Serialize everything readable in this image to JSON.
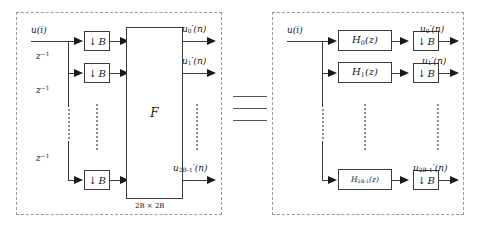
{
  "figure": {
    "relation_symbol": "identical-to",
    "colors": {
      "panel_border": "#9a9a9a",
      "wire": "#3a3a3a",
      "text": "#1a1a1a",
      "dots": "#8d8d8d",
      "background": "#ffffff"
    }
  },
  "left_block": {
    "input_label": "u(i)",
    "delay_labels": [
      "z⁻¹",
      "z⁻¹",
      "z⁻¹"
    ],
    "decimator_symbol": "↓",
    "decimator_factor": "B",
    "decimator_label": "↓ B",
    "transform_label": "F",
    "transform_size_label": "2B × 2B",
    "rows": [
      {
        "output_label": "u₀′(n)",
        "output_base": "u",
        "output_sub": "0",
        "output_arg": "(n)"
      },
      {
        "output_label": "u₁′(n)",
        "output_base": "u",
        "output_sub": "1",
        "output_arg": "(n)"
      },
      {
        "output_label": "u′₂B₋₁(n)",
        "output_base": "u",
        "output_sub": "2B-1",
        "output_arg": "(n)"
      }
    ],
    "ellipsis": "vertical-dots"
  },
  "right_block": {
    "input_label": "u(i)",
    "decimator_symbol": "↓",
    "decimator_factor": "B",
    "decimator_label": "↓ B",
    "rows": [
      {
        "filter_base": "H",
        "filter_sub": "0",
        "filter_arg": "(z)",
        "filter_label": "H₀(z)",
        "output_base": "u",
        "output_sub": "0",
        "output_arg": "(n)",
        "output_label": "u₀′(n)"
      },
      {
        "filter_base": "H",
        "filter_sub": "1",
        "filter_arg": "(z)",
        "filter_label": "H₁(z)",
        "output_base": "u",
        "output_sub": "1",
        "output_arg": "(n)",
        "output_label": "u₁′(n)"
      },
      {
        "filter_base": "H",
        "filter_sub": "2B-1",
        "filter_arg": "(z)",
        "filter_label": "H₂B₋₁(z)",
        "output_base": "u",
        "output_sub": "2B-1",
        "output_arg": "(n)",
        "output_label": "u′₂B₋₁(n)"
      }
    ],
    "ellipsis": "vertical-dots"
  }
}
